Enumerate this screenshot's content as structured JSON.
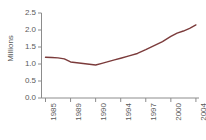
{
  "chart_data": {
    "type": "line",
    "title": "",
    "xlabel": "",
    "ylabel": "Millions",
    "ylim": [
      0.0,
      2.5
    ],
    "yticks": [
      "0.0",
      "0.5",
      "1.0",
      "1.5",
      "2.0",
      "2.5"
    ],
    "ytick_values": [
      0.0,
      0.5,
      1.0,
      1.5,
      2.0,
      2.5
    ],
    "categories": [
      "1985",
      "1989",
      "1990",
      "1994",
      "1997",
      "2000",
      "2004"
    ],
    "xtick_labels": [
      "1985",
      "1989",
      "1990",
      "1994",
      "1997",
      "2000",
      "2004"
    ],
    "grid": false,
    "legend": "none",
    "line_color": "#7B3B3B",
    "axis_color": "#8c8c8c",
    "text_color": "#5a5a5a",
    "series": [
      {
        "name": "Value",
        "x": [
          1985,
          1986,
          1987,
          1988,
          1989,
          1990,
          1991,
          1992,
          1993,
          1994,
          1995,
          1996,
          1997,
          1998,
          1999,
          2000,
          2001,
          2002,
          2003,
          2004
        ],
        "values": [
          1.2,
          1.19,
          1.18,
          1.15,
          1.06,
          0.97,
          1.02,
          1.07,
          1.12,
          1.17,
          1.24,
          1.31,
          1.42,
          1.54,
          1.66,
          1.81,
          1.91,
          1.97,
          2.05,
          2.15
        ]
      }
    ]
  }
}
